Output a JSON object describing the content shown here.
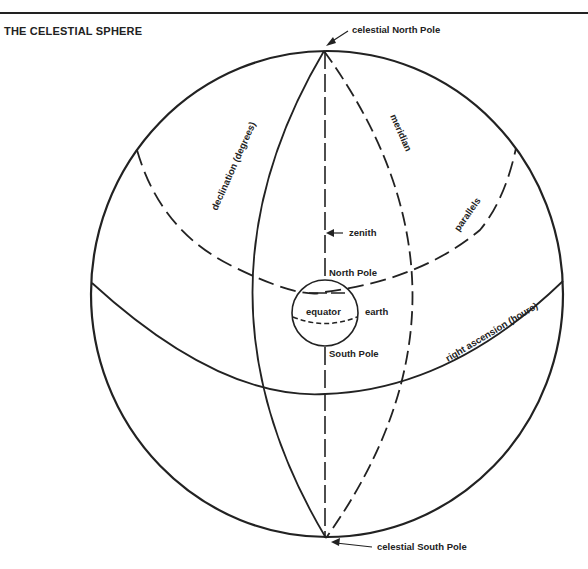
{
  "title": "THE CELESTIAL SPHERE",
  "labels": {
    "celestial_north_pole": "celestial North Pole",
    "celestial_south_pole": "celestial South Pole",
    "declination": "declination (degrees)",
    "meridian": "meridian",
    "parallels": "parallels",
    "zenith": "zenith",
    "north_pole": "North Pole",
    "south_pole": "South Pole",
    "equator": "equator",
    "earth": "earth",
    "right_ascension": "right ascension (hours)"
  },
  "colors": {
    "ink": "#222222",
    "background": "#ffffff"
  }
}
